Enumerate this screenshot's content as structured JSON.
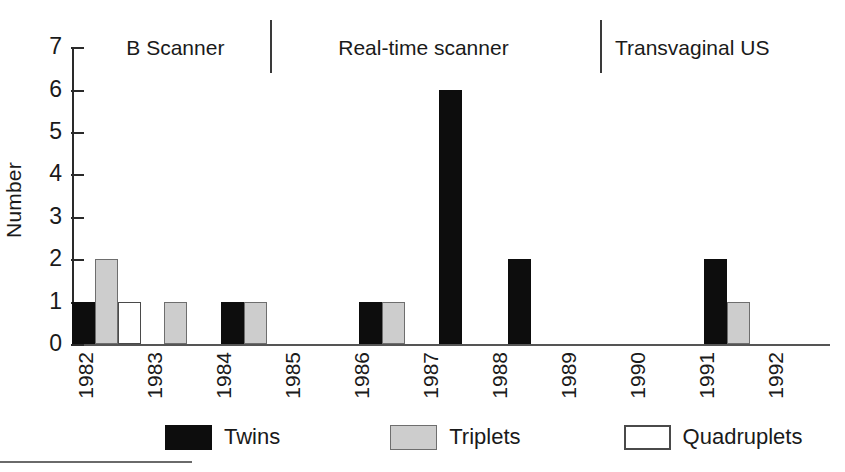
{
  "chart_data": {
    "type": "bar",
    "title": "",
    "xlabel": "",
    "ylabel": "Number",
    "ylim": [
      0,
      7
    ],
    "ytick_values": [
      7,
      6,
      5,
      4,
      3,
      2,
      1,
      0
    ],
    "grid": false,
    "legend_position": "bottom",
    "categories": [
      "1982",
      "1983",
      "1984",
      "1985",
      "1986",
      "1987",
      "1988",
      "1989",
      "1990",
      "1991",
      "1992"
    ],
    "series": [
      {
        "name": "Twins",
        "color": "#0d0d0d",
        "values": [
          1,
          0,
          1,
          0,
          1,
          6,
          2,
          0,
          0,
          2,
          0
        ]
      },
      {
        "name": "Triplets",
        "color": "#cdcdcd",
        "values": [
          2,
          1,
          1,
          0,
          1,
          0,
          0,
          0,
          0,
          1,
          0
        ]
      },
      {
        "name": "Quadruplets",
        "color": "#ffffff",
        "values": [
          1,
          0,
          0,
          0,
          0,
          0,
          0,
          0,
          0,
          0,
          0
        ]
      }
    ],
    "annotations": [
      {
        "label": "B Scanner",
        "spans": [
          "1982",
          "1984"
        ]
      },
      {
        "label": "Real-time scanner",
        "spans": [
          "1985",
          "1988"
        ]
      },
      {
        "label": "Transvaginal US",
        "spans": [
          "1989",
          "1992"
        ]
      }
    ]
  },
  "axis": {
    "ylabel": "Number",
    "yticks": [
      "7",
      "6",
      "5",
      "4",
      "3",
      "2",
      "1",
      "0"
    ],
    "xticks": [
      "1982",
      "1983",
      "1984",
      "1985",
      "1986",
      "1987",
      "1988",
      "1989",
      "1990",
      "1991",
      "1992"
    ]
  },
  "periods": [
    {
      "label": "B Scanner"
    },
    {
      "label": "Real-time scanner"
    },
    {
      "label": "Transvaginal US"
    }
  ],
  "legend": [
    {
      "label": "Twins",
      "swatch": "twins"
    },
    {
      "label": "Triplets",
      "swatch": "triplets"
    },
    {
      "label": "Quadruplets",
      "swatch": "quadruplets"
    }
  ]
}
